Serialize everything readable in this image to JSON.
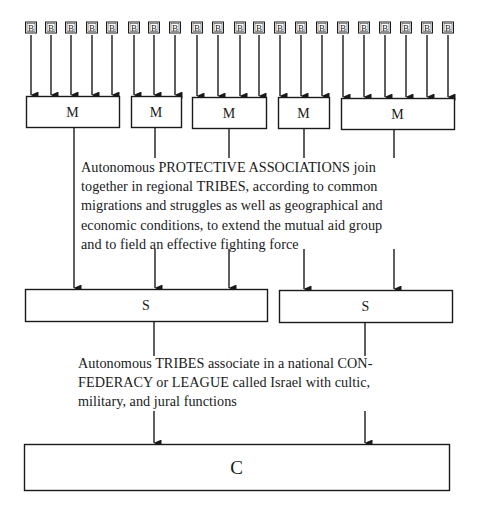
{
  "diagram": {
    "title": "",
    "colors": {
      "line": "#1a1a1a",
      "background": "#ffffff"
    },
    "b_level": {
      "label": "B",
      "box_size": 11,
      "top": 22,
      "centers_x": [
        31,
        51,
        71,
        92,
        112,
        134,
        154,
        175,
        197,
        218,
        240,
        259,
        280,
        301,
        322,
        343,
        364,
        385,
        406,
        427,
        448
      ]
    },
    "m_level": {
      "label": "M",
      "boxes": [
        {
          "label": "M",
          "x": 26,
          "y": 96,
          "w": 93,
          "h": 31,
          "members": 5,
          "out_x": 74
        },
        {
          "label": "M",
          "x": 131,
          "y": 96,
          "w": 50,
          "h": 31,
          "members": 3,
          "out_x": 155
        },
        {
          "label": "M",
          "x": 192,
          "y": 97,
          "w": 74,
          "h": 31,
          "members": 4,
          "out_x": 229
        },
        {
          "label": "M",
          "x": 278,
          "y": 97,
          "w": 51,
          "h": 31,
          "members": 3,
          "out_x": 304
        },
        {
          "label": "M",
          "x": 341,
          "y": 98,
          "w": 113,
          "h": 31,
          "members": 6,
          "out_x": 394
        }
      ]
    },
    "s_level": {
      "label": "S",
      "boxes": [
        {
          "label": "S",
          "x": 25,
          "y": 289,
          "w": 242,
          "h": 32,
          "in_x": [
            74,
            155,
            229
          ],
          "out_x": 154
        },
        {
          "label": "S",
          "x": 279,
          "y": 290,
          "w": 173,
          "h": 32,
          "in_x": [
            304,
            394
          ],
          "out_x": 365
        }
      ]
    },
    "c_level": {
      "label": "C",
      "box": {
        "label": "C",
        "x": 24,
        "y": 444,
        "w": 425,
        "h": 46,
        "in_x": [
          154,
          365
        ]
      }
    },
    "captions": {
      "associations_to_tribes": {
        "lines": [
          "Autonomous PROTECTIVE ASSOCIATIONS join",
          "together in regional TRIBES, according to common",
          "migrations and struggles as well as geographical and",
          "economic conditions, to extend the mutual aid group",
          "and to field an effective fighting force"
        ]
      },
      "tribes_to_confederacy": {
        "lines": [
          "Autonomous TRIBES associate in a national CON-",
          "FEDERACY or LEAGUE called Israel with cultic,",
          "military, and jural functions"
        ]
      }
    }
  }
}
